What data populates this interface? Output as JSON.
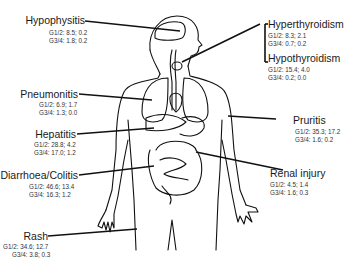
{
  "diagram": {
    "type": "anatomical-annotated-body",
    "labels": [
      {
        "id": "hypophysitis",
        "name": "Hypophysitis",
        "g12": "G1/2: 8.5; 0.2",
        "g34": "G3/4: 1.8; 0.2"
      },
      {
        "id": "hyperthyroidism",
        "name": "Hyperthyroidism",
        "g12": "G1/2: 8.3; 2.1",
        "g34": "G3/4: 0.7; 0.2"
      },
      {
        "id": "hypothyroidism",
        "name": "Hypothyroidism",
        "g12": "G1/2: 15.4; 4.0",
        "g34": "G3/4: 0.2; 0.0"
      },
      {
        "id": "pneumonitis",
        "name": "Pneumonitis",
        "g12": "G1/2: 6.9; 1.7",
        "g34": "G3/4: 1.3; 0.0"
      },
      {
        "id": "hepatitis",
        "name": "Hepatitis",
        "g12": "G1/2: 28.8; 4.2",
        "g34": "G3/4: 17.0; 1.2"
      },
      {
        "id": "pruritis",
        "name": "Pruritis",
        "g12": "G1/2: 35.3; 17.2",
        "g34": "G3/4: 1.6; 0.2"
      },
      {
        "id": "diarrhoea",
        "name": "Diarrhoea/Colitis",
        "g12": "G1/2: 46.6; 13.4",
        "g34": "G3/4: 16.3; 1.2"
      },
      {
        "id": "renal",
        "name": "Renal injury",
        "g12": "G1/2: 4.5; 1.4",
        "g34": "G3/4: 1.6; 0.3"
      },
      {
        "id": "rash",
        "name": "Rash",
        "g12": "G1/2: 34.6; 12.7",
        "g34": "G3/4: 3.8; 0.3"
      }
    ]
  }
}
